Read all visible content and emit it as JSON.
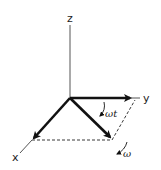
{
  "diagram": {
    "type": "3d-coordinate-axes-rotation",
    "axes": {
      "z_label": "z",
      "y_label": "y",
      "x_label": "x"
    },
    "annotations": {
      "angle_label": "ωt",
      "angular_velocity_label": "ω"
    },
    "colors": {
      "stroke": "#111111",
      "thin_axis": "#555555",
      "background": "#ffffff"
    }
  }
}
